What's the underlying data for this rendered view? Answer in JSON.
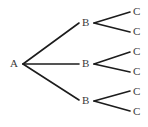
{
  "diagram": {
    "type": "tree-diagram",
    "background_color": "#ffffff",
    "edge_color": "#1c1c1c",
    "label_color": "#3a3a3a",
    "levels": [
      {
        "name": "level-1",
        "count": 1
      },
      {
        "name": "level-2",
        "count": 3
      },
      {
        "name": "level-3",
        "count": 6
      }
    ],
    "nodes": {
      "root": {
        "label": "A",
        "x": 14,
        "y": 64
      },
      "branch": [
        {
          "label": "B",
          "x": 86,
          "y": 22
        },
        {
          "label": "B",
          "x": 86,
          "y": 64
        },
        {
          "label": "B",
          "x": 86,
          "y": 101
        }
      ],
      "leaf": [
        {
          "label": "C",
          "x": 135,
          "y": 12
        },
        {
          "label": "C",
          "x": 135,
          "y": 31
        },
        {
          "label": "C",
          "x": 135,
          "y": 51
        },
        {
          "label": "C",
          "x": 135,
          "y": 71
        },
        {
          "label": "C",
          "x": 135,
          "y": 91
        },
        {
          "label": "C",
          "x": 135,
          "y": 111
        }
      ]
    },
    "edges": [
      {
        "name": "edge-a-b1",
        "x1": 23,
        "y1": 64,
        "x2": 79,
        "y2": 23
      },
      {
        "name": "edge-a-b2",
        "x1": 23,
        "y1": 64,
        "x2": 79,
        "y2": 64
      },
      {
        "name": "edge-a-b3",
        "x1": 23,
        "y1": 64,
        "x2": 79,
        "y2": 100
      },
      {
        "name": "edge-b1-c1",
        "x1": 94,
        "y1": 23,
        "x2": 130,
        "y2": 12
      },
      {
        "name": "edge-b1-c2",
        "x1": 94,
        "y1": 23,
        "x2": 130,
        "y2": 32
      },
      {
        "name": "edge-b2-c3",
        "x1": 94,
        "y1": 64,
        "x2": 130,
        "y2": 52
      },
      {
        "name": "edge-b2-c4",
        "x1": 94,
        "y1": 64,
        "x2": 130,
        "y2": 72
      },
      {
        "name": "edge-b3-c5",
        "x1": 94,
        "y1": 101,
        "x2": 130,
        "y2": 91
      },
      {
        "name": "edge-b3-c6",
        "x1": 94,
        "y1": 101,
        "x2": 130,
        "y2": 111
      }
    ]
  }
}
